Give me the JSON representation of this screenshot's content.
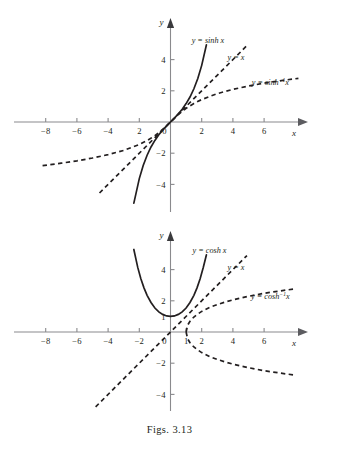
{
  "caption": "Figs. 3.13",
  "chart_data": [
    {
      "type": "line",
      "title": "",
      "xlabel": "x",
      "ylabel": "y",
      "xlim": [
        -9,
        8
      ],
      "ylim": [
        -5.6,
        5.2
      ],
      "grid": false,
      "legend_position": "inline-annotations",
      "xticks": [
        -8,
        -6,
        -4,
        2,
        0,
        2,
        4,
        6
      ],
      "xtick_labels": [
        "−8",
        "−6",
        "−4",
        "2",
        "0",
        "2",
        "4",
        "6"
      ],
      "xtick_values": [
        -8,
        -6,
        -4,
        -2,
        0,
        2,
        4,
        6
      ],
      "yticks": [
        4,
        2,
        -2,
        -4
      ],
      "ytick_labels": [
        "4",
        "2",
        "−2",
        "−4"
      ],
      "series": [
        {
          "name": "y = sinh x",
          "style": "solid",
          "label": "y = sinh x",
          "label_parts": {
            "lhs": "y",
            "eq": "=",
            "fn": "sinh",
            "sup": "",
            "arg": "x"
          },
          "x": [
            -2.35,
            -2.0,
            -1.75,
            -1.5,
            -1.25,
            -1.0,
            -0.75,
            -0.5,
            -0.25,
            0,
            0.25,
            0.5,
            0.75,
            1.0,
            1.25,
            1.5,
            1.75,
            2.0,
            2.3
          ],
          "y": [
            -5.2,
            -3.63,
            -2.79,
            -2.13,
            -1.6,
            -1.18,
            -0.82,
            -0.52,
            -0.25,
            0,
            0.25,
            0.52,
            0.82,
            1.18,
            1.6,
            2.13,
            2.79,
            3.63,
            4.94
          ]
        },
        {
          "name": "y = x",
          "style": "dashed",
          "label": "y = x",
          "label_parts": {
            "lhs": "y",
            "eq": "=",
            "fn": "",
            "sup": "",
            "arg": "x"
          },
          "x": [
            -4.55,
            4.9
          ],
          "y": [
            -4.55,
            4.9
          ]
        },
        {
          "name": "y = sinh⁻¹ x",
          "style": "dashed",
          "label": "y = sinh⁻¹x",
          "label_parts": {
            "lhs": "y",
            "eq": "=",
            "fn": "sinh",
            "sup": "−1",
            "arg": "x"
          },
          "x": [
            -8.2,
            -7,
            -6,
            -5,
            -4,
            -3,
            -2,
            -1.5,
            -1,
            -0.5,
            0,
            0.5,
            1,
            1.5,
            2,
            3,
            4,
            5,
            6,
            7,
            8.2
          ],
          "y": [
            -2.8,
            -2.64,
            -2.49,
            -2.31,
            -2.09,
            -1.82,
            -1.44,
            -1.19,
            -0.88,
            -0.48,
            0,
            0.48,
            0.88,
            1.19,
            1.44,
            1.82,
            2.09,
            2.31,
            2.49,
            2.64,
            2.8
          ]
        }
      ],
      "annotations": [
        {
          "text": "y = sinh x",
          "x": 2.4,
          "y": 5.05
        },
        {
          "text": "y = x",
          "x": 4.2,
          "y": 4.0
        },
        {
          "text": "y = sinh⁻¹x",
          "x": 6.4,
          "y": 2.35
        }
      ]
    },
    {
      "type": "line",
      "title": "",
      "xlabel": "x",
      "ylabel": "y",
      "xlim": [
        -9,
        8
      ],
      "ylim": [
        -5.6,
        5.2
      ],
      "grid": false,
      "legend_position": "inline-annotations",
      "xticks": [
        -8,
        -6,
        -4,
        -2,
        0,
        1,
        2,
        4,
        6
      ],
      "xtick_labels": [
        "−8",
        "−6",
        "−4",
        "−2",
        "0",
        "1",
        "2",
        "4",
        "6"
      ],
      "yticks": [
        4,
        2,
        1,
        -2,
        -4
      ],
      "ytick_labels": [
        "4",
        "2",
        "1",
        "−2",
        "−4"
      ],
      "series": [
        {
          "name": "y = cosh x",
          "style": "solid",
          "label": "y = cosh x",
          "label_parts": {
            "lhs": "y",
            "eq": "=",
            "fn": "cosh",
            "sup": "",
            "arg": "x"
          },
          "x": [
            -2.35,
            -2.1,
            -1.9,
            -1.7,
            -1.5,
            -1.25,
            -1.0,
            -0.75,
            -0.5,
            -0.25,
            0,
            0.25,
            0.5,
            0.75,
            1.0,
            1.25,
            1.5,
            1.7,
            1.9,
            2.1,
            2.3
          ],
          "y": [
            5.29,
            4.14,
            3.42,
            2.83,
            2.35,
            1.89,
            1.54,
            1.29,
            1.13,
            1.03,
            1.0,
            1.03,
            1.13,
            1.29,
            1.54,
            1.89,
            2.35,
            2.83,
            3.42,
            4.14,
            4.94
          ]
        },
        {
          "name": "y = x",
          "style": "dashed",
          "label": "y = x",
          "label_parts": {
            "lhs": "y",
            "eq": "=",
            "fn": "",
            "sup": "",
            "arg": "x"
          },
          "x": [
            -4.8,
            4.9
          ],
          "y": [
            -4.8,
            4.9
          ]
        },
        {
          "name": "y = cosh⁻¹ x (upper branch)",
          "style": "dashed",
          "label": "y = cosh⁻¹x",
          "label_parts": {
            "lhs": "y",
            "eq": "=",
            "fn": "cosh",
            "sup": "−1",
            "arg": "x"
          },
          "x": [
            1.0,
            1.1,
            1.25,
            1.5,
            1.75,
            2.0,
            2.5,
            3.0,
            3.5,
            4.0,
            5.0,
            6.0,
            7.0,
            8.0
          ],
          "y": [
            0,
            0.44,
            0.69,
            0.96,
            1.15,
            1.32,
            1.57,
            1.76,
            1.92,
            2.06,
            2.29,
            2.48,
            2.63,
            2.77
          ]
        },
        {
          "name": "y = cosh⁻¹ x (lower branch)",
          "style": "dashed",
          "label": "",
          "label_parts": {
            "lhs": "",
            "eq": "",
            "fn": "",
            "sup": "",
            "arg": ""
          },
          "x": [
            1.0,
            1.1,
            1.25,
            1.5,
            1.75,
            2.0,
            2.5,
            3.0,
            3.5,
            4.0,
            5.0,
            6.0,
            7.0,
            8.0
          ],
          "y": [
            0,
            -0.44,
            -0.69,
            -0.96,
            -1.15,
            -1.32,
            -1.57,
            -1.76,
            -1.92,
            -2.06,
            -2.29,
            -2.48,
            -2.63,
            -2.77
          ]
        }
      ],
      "annotations": [
        {
          "text": "y = cosh x",
          "x": 2.5,
          "y": 5.05
        },
        {
          "text": "y = x",
          "x": 4.2,
          "y": 4.0
        },
        {
          "text": "y = cosh⁻¹x",
          "x": 6.4,
          "y": 2.1
        }
      ]
    }
  ],
  "sinh_panel": {
    "xaxis_label": "x",
    "yaxis_label": "y",
    "labels": {
      "sinh": {
        "lhs": "y",
        "eq": "=",
        "fn": "sinh",
        "arg": "x"
      },
      "identity": {
        "lhs": "y",
        "eq": "=",
        "arg": "x"
      },
      "arcsinh": {
        "lhs": "y",
        "eq": "=",
        "fn": "sinh",
        "sup": "−1",
        "arg": "x"
      }
    },
    "xticks": [
      "−8",
      "−6",
      "−4",
      "2",
      "0",
      "2",
      "4",
      "6"
    ],
    "yticks": [
      "4",
      "2",
      "−2",
      "−4"
    ]
  },
  "cosh_panel": {
    "xaxis_label": "x",
    "yaxis_label": "y",
    "labels": {
      "cosh": {
        "lhs": "y",
        "eq": "=",
        "fn": "cosh",
        "arg": "x"
      },
      "identity": {
        "lhs": "y",
        "eq": "=",
        "arg": "x"
      },
      "arccosh": {
        "lhs": "y",
        "eq": "=",
        "fn": "cosh",
        "sup": "−1",
        "arg": "x"
      }
    },
    "xticks": [
      "−8",
      "−6",
      "−4",
      "−2",
      "0",
      "1",
      "2",
      "4",
      "6"
    ],
    "yticks": [
      "4",
      "2",
      "1",
      "−2",
      "−4"
    ]
  }
}
